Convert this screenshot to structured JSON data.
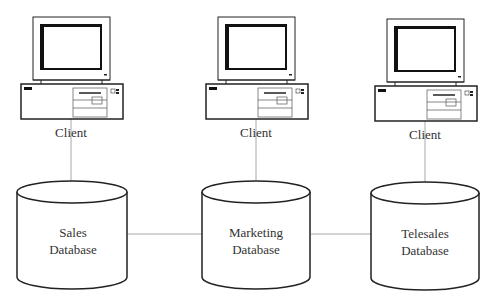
{
  "diagram": {
    "colors": {
      "stroke": "#222222",
      "connector": "#a8a8a8",
      "text": "#333333",
      "background": "#ffffff"
    },
    "clients": [
      {
        "id": "client-1",
        "label": "Client",
        "icon": "desktop-computer-icon",
        "x": 71
      },
      {
        "id": "client-2",
        "label": "Client",
        "icon": "desktop-computer-icon",
        "x": 256
      },
      {
        "id": "client-3",
        "label": "Client",
        "icon": "desktop-computer-icon",
        "x": 425
      }
    ],
    "databases": [
      {
        "id": "sales-db",
        "line1": "Sales",
        "line2": "Database",
        "icon": "database-cylinder-icon",
        "x": 72
      },
      {
        "id": "marketing-db",
        "line1": "Marketing",
        "line2": "Database",
        "icon": "database-cylinder-icon",
        "x": 256
      },
      {
        "id": "telesales-db",
        "line1": "Telesales",
        "line2": "Database",
        "icon": "database-cylinder-icon",
        "x": 425
      }
    ],
    "connections": [
      {
        "from": "client-1",
        "to": "sales-db"
      },
      {
        "from": "client-2",
        "to": "marketing-db"
      },
      {
        "from": "client-3",
        "to": "telesales-db"
      },
      {
        "from": "sales-db",
        "to": "marketing-db"
      },
      {
        "from": "marketing-db",
        "to": "telesales-db"
      }
    ]
  }
}
